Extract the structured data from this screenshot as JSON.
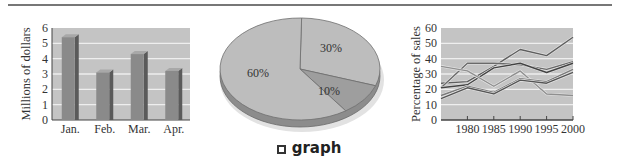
{
  "caption": {
    "icon": "hollow-square-icon",
    "label": "graph"
  },
  "colors": {
    "plot_bg": "#c4c4c4",
    "grid": "#eeeeee",
    "bar_front": "#8a8a8a",
    "bar_side": "#5a5a5a",
    "pie_main": "#bdbdbd",
    "pie_small": "#9e9e9e",
    "pie_edge": "#8c8c8c",
    "axis": "#444444"
  },
  "chart_data": [
    {
      "type": "bar",
      "title": "",
      "xlabel": "",
      "ylabel": "Millions of dollars",
      "categories": [
        "Jan.",
        "Feb.",
        "Mar.",
        "Apr."
      ],
      "values": [
        5.4,
        3.1,
        4.3,
        3.2
      ],
      "ylim": [
        0,
        6
      ],
      "yticks": [
        0,
        1,
        2,
        3,
        4,
        5,
        6
      ],
      "grid": true,
      "legend": null
    },
    {
      "type": "pie",
      "title": "",
      "labels": [
        "60%",
        "30%",
        "10%"
      ],
      "values": [
        60,
        30,
        10
      ],
      "legend": null
    },
    {
      "type": "line",
      "title": "",
      "xlabel": "",
      "ylabel": "Percentage of sales",
      "x": [
        1975,
        1980,
        1985,
        1990,
        1995,
        2000
      ],
      "xticks": [
        "1980",
        "1985",
        "1990",
        "1995",
        "2000"
      ],
      "ylim": [
        0,
        60
      ],
      "yticks": [
        0,
        10,
        20,
        30,
        40,
        50,
        60
      ],
      "grid": true,
      "series": [
        {
          "name": "Series 1",
          "values": [
            24,
            25,
            35,
            46,
            42,
            54
          ]
        },
        {
          "name": "Series 2",
          "values": [
            21,
            37,
            37,
            36,
            33,
            38
          ]
        },
        {
          "name": "Series 3",
          "values": [
            21,
            23,
            34,
            37,
            31,
            37
          ]
        },
        {
          "name": "Series 4",
          "values": [
            35,
            32,
            22,
            32,
            17,
            16
          ]
        },
        {
          "name": "Series 5",
          "values": [
            16,
            22,
            18,
            27,
            25,
            33
          ]
        },
        {
          "name": "Series 6",
          "values": [
            14,
            21,
            17,
            26,
            24,
            31
          ]
        }
      ],
      "legend": null
    }
  ]
}
